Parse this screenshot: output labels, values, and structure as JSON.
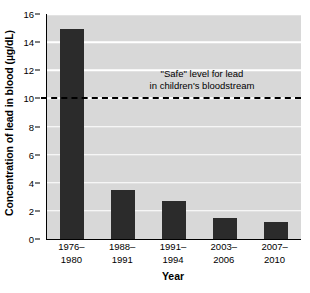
{
  "chart_data": {
    "type": "bar",
    "title": "",
    "xlabel": "Year",
    "ylabel": "Concentration of lead in blood (µg/dL)",
    "categories": [
      "1976–\n1980",
      "1988–\n1991",
      "1991–\n1994",
      "2003–\n2006",
      "2007–\n2010"
    ],
    "category_lines": [
      [
        "1976–",
        "1980"
      ],
      [
        "1988–",
        "1991"
      ],
      [
        "1991–",
        "1994"
      ],
      [
        "2003–",
        "2006"
      ],
      [
        "2007–",
        "2010"
      ]
    ],
    "values": [
      14.9,
      3.5,
      2.7,
      1.5,
      1.2
    ],
    "ylim": [
      0,
      16
    ],
    "ytick_step": 2,
    "yticks": [
      0,
      2,
      4,
      6,
      8,
      10,
      12,
      14,
      16
    ],
    "ytick_labels": [
      "0",
      "2",
      "4",
      "6",
      "8",
      "10",
      "12",
      "14",
      "16"
    ],
    "grid": true,
    "grid_orientation": "horizontal",
    "legend": false,
    "annotations": [
      {
        "name": "safe-level",
        "line1": "\"Safe\" level for lead",
        "line2": "in children's bloodstream",
        "y_value": 10,
        "style": "dashed-reference-line"
      }
    ],
    "colors": {
      "bar": "#2b2b2b",
      "plot_background": "#d8d8d8",
      "gridline": "#ffffff",
      "axis": "#000000",
      "threshold_line": "#000000",
      "page_background": "#ffffff"
    }
  }
}
